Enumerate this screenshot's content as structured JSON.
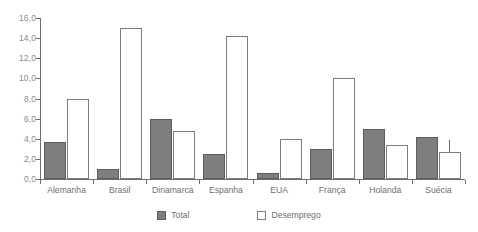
{
  "chart_data": {
    "type": "bar",
    "title": "",
    "subtitle": "",
    "xlabel": "",
    "ylabel": "",
    "ylim": [
      0,
      16
    ],
    "ytick_labels": [
      "16,0",
      "14,0",
      "12,0",
      "10,0",
      "8,0",
      "6,0",
      "4,0",
      "2,0",
      "0,0"
    ],
    "ytick_values": [
      16,
      14,
      12,
      10,
      8,
      6,
      4,
      2,
      0
    ],
    "grid": false,
    "legend_position": "bottom",
    "categories": [
      "Alemanha",
      "Brasil",
      "Dinamarca",
      "Espanha",
      "EUA",
      "França",
      "Holanda",
      "Suécia"
    ],
    "series": [
      {
        "name": "Total",
        "color": "#7e7e7e",
        "values": [
          3.7,
          1.0,
          6.0,
          2.5,
          0.6,
          3.0,
          5.0,
          4.2
        ]
      },
      {
        "name": "Desemprego",
        "color": "#ffffff",
        "values": [
          8.0,
          15.0,
          4.8,
          14.2,
          4.0,
          10.0,
          3.4,
          2.7
        ]
      }
    ]
  },
  "legend": {
    "items": [
      {
        "label": "Total",
        "style": "filled"
      },
      {
        "label": "Desemprego",
        "style": "hollow"
      }
    ]
  },
  "colors": {
    "total_fill": "#7e7e7e",
    "total_stroke": "#5d5d5d",
    "unemp_fill": "#ffffff",
    "unemp_stroke": "#7d7d7d",
    "axis": "#6e6e6e",
    "tick_text": "#8a8a8a",
    "label_text": "#6f6f6f",
    "background": "#ffffff"
  }
}
